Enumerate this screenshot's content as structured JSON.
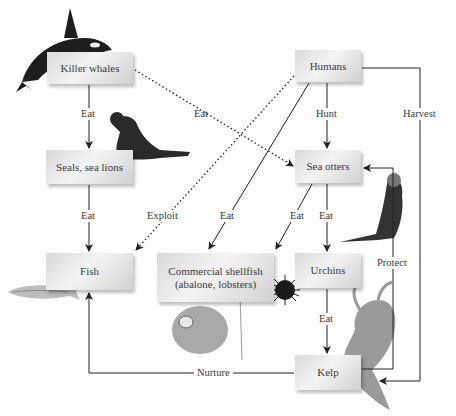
{
  "diagram": {
    "nodes": {
      "killer_whales": "Killer whales",
      "seals": "Seals, sea lions",
      "fish": "Fish",
      "humans": "Humans",
      "sea_otters": "Sea otters",
      "shellfish_line1": "Commercial shellfish",
      "shellfish_line2": "(abalone, lobsters)",
      "urchins": "Urchins",
      "kelp": "Kelp"
    },
    "edges": {
      "whales_seals": "Eat",
      "whales_otters": "Eat",
      "seals_fish": "Eat",
      "humans_fish": "Exploit",
      "humans_shellfish": "Eat",
      "humans_otters": "Hunt",
      "humans_kelp": "Harvest",
      "otters_shellfish": "Eat",
      "otters_urchins": "Eat",
      "urchins_kelp": "Eat",
      "kelp_otters": "Protect",
      "kelp_fish": "Nurture"
    },
    "illustrations": [
      "killer-whale",
      "sea-lion",
      "fish",
      "abalone",
      "sea-urchin",
      "sea-otter",
      "kelp"
    ]
  }
}
